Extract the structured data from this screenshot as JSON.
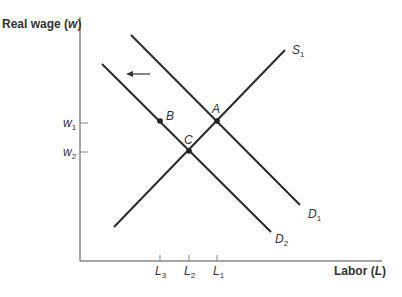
{
  "diagram": {
    "y_axis": {
      "label_prefix": "Real wage (",
      "label_var": "w",
      "label_suffix": ")"
    },
    "x_axis": {
      "label_prefix": "Labor (",
      "label_var": "L",
      "label_suffix": ")"
    },
    "y_ticks": [
      {
        "base": "w",
        "sub": "1"
      },
      {
        "base": "w",
        "sub": "2"
      }
    ],
    "x_ticks": [
      {
        "base": "L",
        "sub": "3"
      },
      {
        "base": "L",
        "sub": "2"
      },
      {
        "base": "L",
        "sub": "1"
      }
    ],
    "curves": {
      "S1": {
        "base": "S",
        "sub": "1"
      },
      "D1": {
        "base": "D",
        "sub": "1"
      },
      "D2": {
        "base": "D",
        "sub": "2"
      }
    },
    "points": {
      "A": "A",
      "B": "B",
      "C": "C"
    },
    "shift_arrow": "left-arrow-icon",
    "colors": {
      "line": "#2a2a2a",
      "axis": "#888888",
      "text": "#333333"
    }
  }
}
